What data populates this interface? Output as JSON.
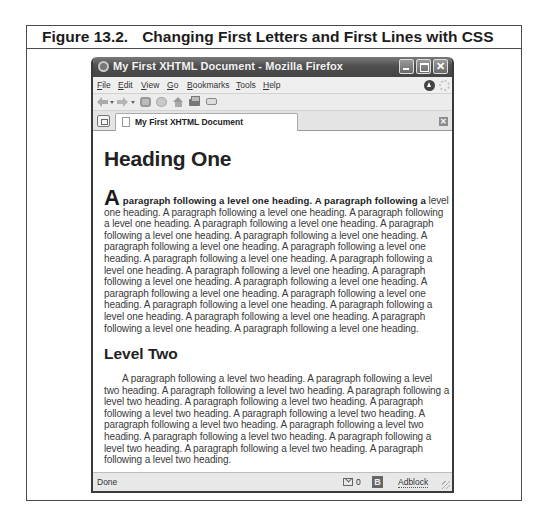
{
  "figure": {
    "number": "Figure 13.2.",
    "title": "Changing First Letters and First Lines with CSS"
  },
  "window": {
    "title": "My First XHTML Document - Mozilla Firefox",
    "controls": [
      "minimize",
      "maximize",
      "close"
    ]
  },
  "menubar": {
    "items": [
      {
        "label": "File",
        "accel": "F",
        "rest": "ile"
      },
      {
        "label": "Edit",
        "accel": "E",
        "rest": "dit"
      },
      {
        "label": "View",
        "accel": "V",
        "rest": "iew"
      },
      {
        "label": "Go",
        "accel": "G",
        "rest": "o"
      },
      {
        "label": "Bookmarks",
        "accel": "B",
        "rest": "ookmarks"
      },
      {
        "label": "Tools",
        "accel": "T",
        "rest": "ools"
      },
      {
        "label": "Help",
        "accel": "H",
        "rest": "elp"
      }
    ]
  },
  "toolbar": {
    "icons": [
      "back-icon",
      "forward-icon",
      "reload-icon",
      "stop-icon",
      "home-icon",
      "print-icon",
      "send-page-icon"
    ]
  },
  "tabs": [
    {
      "label": "My First XHTML Document",
      "active": true
    }
  ],
  "page": {
    "heading1": "Heading One",
    "paragraph1": {
      "first_letter": "A",
      "first_line_rest": " paragraph following a level one heading. A paragraph following a",
      "rest": "level one heading. A paragraph following a level one heading. A paragraph following a level one heading. A paragraph following a level one heading. A paragraph following a level one heading. A paragraph following a level one heading. A paragraph following a level one heading. A paragraph following a level one heading. A paragraph following a level one heading. A paragraph following a level one heading. A paragraph following a level one heading. A paragraph following a level one heading. A paragraph following a level one heading. A paragraph following a level one heading. A paragraph following a level one heading. A paragraph following a level one heading. A paragraph following a level one heading. A paragraph following a level one heading. A paragraph following a level one heading. A paragraph following a level one heading."
    },
    "heading2": "Level Two",
    "paragraph2": "A paragraph following a level two heading. A paragraph following a level two heading. A paragraph following a level two heading. A paragraph following a level two heading. A paragraph following a level two heading. A paragraph following a level two heading. A paragraph following a level two heading. A paragraph following a level two heading. A paragraph following a level two heading. A paragraph following a level two heading. A paragraph following a level two heading. A paragraph following a level two heading. A paragraph following a level two heading."
  },
  "statusbar": {
    "status": "Done",
    "mail_count": "0",
    "badge": "B",
    "adblock": "Adblock"
  }
}
